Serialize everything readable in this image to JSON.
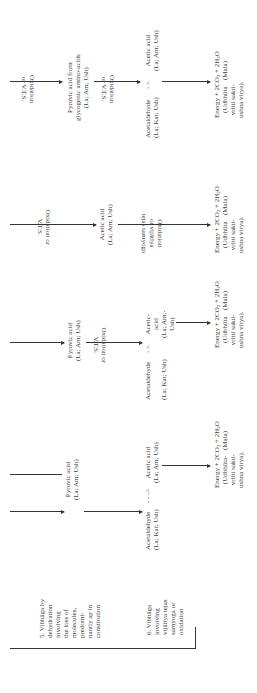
{
  "rows": [
    {
      "label": "5. Vibhāga by\ndehydration\ninvolving\nthe loss of\nmolecules,\npredomi-\nnantly ap in\nconstitution"
    },
    {
      "label": "6. Vibhāga\ninvolving\nvijātīya tejas\nsamyoga or\noxidation"
    }
  ],
  "columns": [
    {
      "row5_input": "Pyruvic acid\n(La; Am; Ush)",
      "row6_step1": "Acetaldehyde",
      "row6_step1_props": "(La; Kat; Ush)",
      "arrow_sym": "- - ->",
      "row6_step2": "Acetic acid\n(La; Am; Ush)",
      "energy": "Energy + 2CO2 + 2H2O",
      "energy_sub": "(Mala)",
      "energy_note": "(Udbhūta-\nvritti sakti-\nushna virya)."
    },
    {
      "row5_input": "Pyruvic acid\n(La; Am; Ush)",
      "oxidation_label": "Oxidation or\nV.T.S.",
      "row6_step1": "Acetaldehyde",
      "row6_step1_props": "(La; Kat; Ush)",
      "arrow_sym": "- >",
      "row6_step2": "Acetic-\nacid\n(La; Am;-\nUsh)",
      "energy": "Energy + 2CO2 + 2H2O",
      "energy_sub": "(Mala)",
      "energy_note": "(Udbhūta\nvritti sakti-\nushna virya)."
    },
    {
      "oxidation_label": "Oxidation or\nV.T.S.",
      "row6_step1": "Acetic acid\n(La; Am; Ush)",
      "oxidation_label2": "Oxidation\nor vijātīya\ntejas samyoga",
      "energy": "Energy + 2CO2 + 2H2O",
      "energy_sub": "(Mala)",
      "energy_note": "(Udbhūta\nvritti sakti-\nushna virya)."
    },
    {
      "oxidation_label": "Oxidation\nor V.T.S.",
      "row5_input": "Pyruvic acid from\nglycogenic amino-acids\n(La; Am; Ush)",
      "oxidation_label2": "Oxidation\nor V.T.S.",
      "row6_step1": "Acetaldehyde",
      "row6_step1_props": "(La; Kat; Ush)",
      "arrow_sym": "- >",
      "row6_step2": "Acetic acid\n(La; Am; Ush)",
      "energy": "Energy + 2CO2 + 2H2O",
      "energy_sub": "(Mala)",
      "energy_note": "(Udbhūta\nvritti sakti-\nushna virya)."
    }
  ]
}
